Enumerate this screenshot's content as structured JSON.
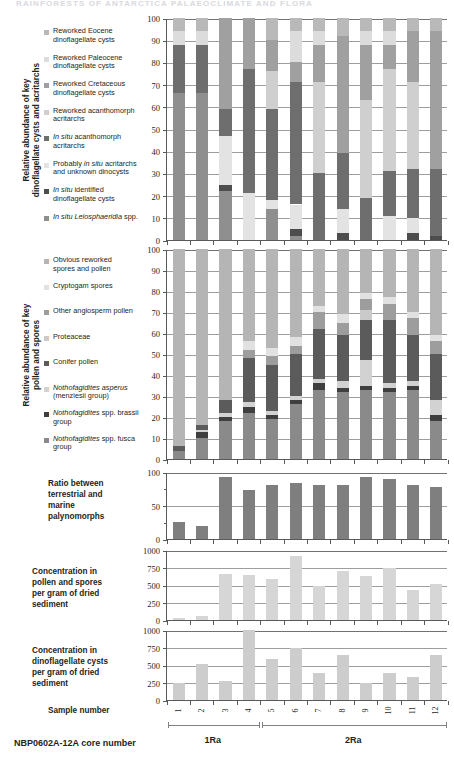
{
  "figure": {
    "running_header": "RAINFORESTS OF ANTARCTICA  PALAEOCLIMATE AND FLORA",
    "bottom_caption": "NBP0602A-12A core number",
    "sample_number_label": "Sample number"
  },
  "samples": [
    "1",
    "2",
    "3",
    "4",
    "5",
    "6",
    "7",
    "8",
    "9",
    "10",
    "11",
    "12"
  ],
  "cores": [
    {
      "label": "1Ra",
      "from": 1,
      "to": 4
    },
    {
      "label": "2Ra",
      "from": 5,
      "to": 12
    }
  ],
  "palette": {
    "dino_reworked_eocene": "#b9b9b9",
    "dino_reworked_paleocene": "#dcdcdc",
    "dino_reworked_cretaceous": "#a0a0a0",
    "dino_reworked_acanthomorph": "#cfcfcf",
    "dino_insitu_acanthomorph": "#6e6e6e",
    "dino_probably_insitu": "#e3e3e3",
    "dino_insitu_identified": "#4d4d4d",
    "dino_insitu_leiosphaeridia": "#8f8f8f",
    "pol_obvious_reworked": "#b5b5b5",
    "pol_cryptogam": "#e1e1e1",
    "pol_other_angiosperm": "#9d9d9d",
    "pol_proteaceae": "#cacaca",
    "pol_conifer": "#5b5b5b",
    "pol_notho_asperus": "#d2d2d2",
    "pol_notho_brassii": "#3f3f3f",
    "pol_notho_fusca": "#8a8a8a",
    "bar_solid_ratio": "#7f7f7f",
    "bar_solid_pollen_conc": "#d6d6d6",
    "bar_solid_dino_conc": "#cdcdcd",
    "axis": "#58595b",
    "grid": "#8c8c8c"
  },
  "panels": {
    "dino": {
      "axis_title": "Relative abundance of key\ndinoflagellate cysts and acritarchs",
      "legend": [
        {
          "key": "dino_reworked_eocene",
          "text": "Reworked Eocene\ndinoflagellate cysts"
        },
        {
          "key": "dino_reworked_paleocene",
          "text": "Reworked Paleocene\ndinoflagellate cysts"
        },
        {
          "key": "dino_reworked_cretaceous",
          "text": "Reworked Cretaceous\ndinoflagellate cysts"
        },
        {
          "key": "dino_reworked_acanthomorph",
          "text": "Reworked acanthomorph\nacritarchs"
        },
        {
          "key": "dino_insitu_acanthomorph",
          "text": "In situ acanthomorph\nacritarchs",
          "italic_prefix": "In situ"
        },
        {
          "key": "dino_probably_insitu",
          "text": "Probably in situ acritarchs\nand unknown dinocysts",
          "italic_prefix": "in situ"
        },
        {
          "key": "dino_insitu_identified",
          "text": "In situ identified\ndinoflagellate cysts",
          "italic_prefix": "In situ"
        },
        {
          "key": "dino_insitu_leiosphaeridia",
          "text": "In situ Leiosphaeridia spp.",
          "italic_prefix": "In situ Leiosphaeridia"
        }
      ],
      "yticks": [
        0,
        10,
        20,
        30,
        40,
        50,
        60,
        70,
        80,
        90,
        100
      ],
      "ylim": [
        0,
        100
      ]
    },
    "pollen": {
      "axis_title": "Relative abundance of key\npollen and spores",
      "legend": [
        {
          "key": "pol_obvious_reworked",
          "text": "Obvious reworked\nspores and pollen"
        },
        {
          "key": "pol_cryptogam",
          "text": "Cryptogam spores"
        },
        {
          "key": "pol_other_angiosperm",
          "text": "Other angiosperm pollen"
        },
        {
          "key": "pol_proteaceae",
          "text": "Proteaceae"
        },
        {
          "key": "pol_conifer",
          "text": "Conifer pollen"
        },
        {
          "key": "pol_notho_asperus",
          "text": "Nothofagidites asperus\n(menziesii group)",
          "italic_prefix": "Nothofagidites asperus"
        },
        {
          "key": "pol_notho_brassii",
          "text": "Nothofagidites spp. brassii\ngroup",
          "italic_prefix": "Nothofagidites"
        },
        {
          "key": "pol_notho_fusca",
          "text": "Nothofagidites  spp. fusca\ngroup",
          "italic_prefix": "Nothofagidites"
        }
      ],
      "yticks": [
        0,
        10,
        20,
        30,
        40,
        50,
        60,
        70,
        80,
        90,
        100
      ],
      "ylim": [
        0,
        100
      ]
    },
    "ratio": {
      "caption": "Ratio between\nterrestrial and\nmarine\npalynomorphs",
      "yticks": [
        0,
        50,
        100
      ],
      "ylim": [
        0,
        100
      ]
    },
    "pollen_conc": {
      "caption": "Concentration in\npollen and spores\nper gram of dried\nsediment",
      "yticks": [
        0,
        250,
        500,
        750,
        1000
      ],
      "ylim": [
        0,
        1000
      ]
    },
    "dino_conc": {
      "caption": "Concentration in\ndinoflagellate cysts\nper gram of dried\nsediment",
      "yticks": [
        0,
        250,
        500,
        750,
        1000
      ],
      "ylim": [
        0,
        1000
      ]
    }
  },
  "chart_data": [
    {
      "type": "bar",
      "id": "dinoflagellate-relative-abundance",
      "stacked": true,
      "title": "Relative abundance of key dinoflagellate cysts and acritarchs",
      "xlabel": "Sample number",
      "ylabel": "Relative abundance (%)",
      "ylim": [
        0,
        100
      ],
      "yticks": [
        0,
        10,
        20,
        30,
        40,
        50,
        60,
        70,
        80,
        90,
        100
      ],
      "grid": true,
      "legend_position": "left",
      "categories": [
        "1",
        "2",
        "3",
        "4",
        "5",
        "6",
        "7",
        "8",
        "9",
        "10",
        "11",
        "12"
      ],
      "series": [
        {
          "name": "In situ Leiosphaeridia spp.",
          "key": "dino_insitu_leiosphaeridia",
          "values": [
            66,
            66,
            22,
            0,
            14,
            2,
            0,
            0,
            0,
            0,
            0,
            0
          ]
        },
        {
          "name": "In situ identified dinoflagellate cysts",
          "key": "dino_insitu_identified",
          "values": [
            0,
            0,
            3,
            0,
            0,
            3,
            0,
            3,
            0,
            0,
            3,
            2
          ]
        },
        {
          "name": "Probably in situ acritarchs and unknown dinocysts",
          "key": "dino_probably_insitu",
          "values": [
            0,
            0,
            22,
            21,
            4,
            11,
            0,
            11,
            0,
            11,
            7,
            0
          ]
        },
        {
          "name": "In situ acanthomorph acritarchs",
          "key": "dino_insitu_acanthomorph",
          "values": [
            22,
            22,
            12,
            56,
            41,
            55,
            30,
            25,
            19,
            20,
            22,
            30
          ]
        },
        {
          "name": "Reworked acanthomorph acritarchs",
          "key": "dino_reworked_acanthomorph",
          "values": [
            0,
            0,
            0,
            0,
            17,
            0,
            41,
            0,
            44,
            46,
            39,
            0
          ]
        },
        {
          "name": "Reworked Cretaceous dinoflagellate cysts",
          "key": "dino_reworked_cretaceous",
          "values": [
            0,
            0,
            41,
            23,
            14,
            9,
            17,
            53,
            25,
            11,
            23,
            62
          ]
        },
        {
          "name": "Reworked Paleocene dinoflagellate cysts",
          "key": "dino_reworked_paleocene",
          "values": [
            6,
            6,
            0,
            0,
            0,
            14,
            6,
            0,
            6,
            6,
            0,
            0
          ]
        },
        {
          "name": "Reworked Eocene dinoflagellate cysts",
          "key": "dino_reworked_eocene",
          "values": [
            6,
            6,
            0,
            0,
            10,
            6,
            6,
            8,
            6,
            6,
            6,
            6
          ]
        }
      ]
    },
    {
      "type": "bar",
      "id": "pollen-spores-relative-abundance",
      "stacked": true,
      "title": "Relative abundance of key pollen and spores",
      "xlabel": "Sample number",
      "ylabel": "Relative abundance (%)",
      "ylim": [
        0,
        100
      ],
      "yticks": [
        0,
        10,
        20,
        30,
        40,
        50,
        60,
        70,
        80,
        90,
        100
      ],
      "grid": true,
      "legend_position": "left",
      "categories": [
        "1",
        "2",
        "3",
        "4",
        "5",
        "6",
        "7",
        "8",
        "9",
        "10",
        "11",
        "12"
      ],
      "series": [
        {
          "name": "Nothofagidites spp. fusca group",
          "key": "pol_notho_fusca",
          "values": [
            4,
            10,
            18,
            22,
            19,
            26,
            33,
            32,
            33,
            32,
            33,
            18
          ]
        },
        {
          "name": "Nothofagidites spp. brassii group",
          "key": "pol_notho_brassii",
          "values": [
            0,
            3,
            2,
            3,
            2,
            2,
            3,
            2,
            2,
            2,
            2,
            3
          ]
        },
        {
          "name": "Nothofagidites asperus (menziesii group)",
          "key": "pol_notho_asperus",
          "values": [
            0,
            1,
            2,
            2,
            2,
            2,
            2,
            3,
            12,
            2,
            2,
            7
          ]
        },
        {
          "name": "Conifer pollen",
          "key": "pol_conifer",
          "values": [
            2,
            2,
            6,
            21,
            22,
            20,
            24,
            22,
            19,
            30,
            22,
            22
          ]
        },
        {
          "name": "Proteaceae",
          "key": "pol_proteaceae",
          "values": [
            0,
            0,
            0,
            0,
            0,
            0,
            0,
            0,
            5,
            0,
            0,
            0
          ]
        },
        {
          "name": "Other angiosperm pollen",
          "key": "pol_other_angiosperm",
          "values": [
            0,
            0,
            0,
            4,
            4,
            4,
            8,
            6,
            5,
            8,
            8,
            6
          ]
        },
        {
          "name": "Cryptogam spores",
          "key": "pol_cryptogam",
          "values": [
            0,
            0,
            0,
            4,
            4,
            4,
            3,
            4,
            3,
            3,
            3,
            3
          ]
        },
        {
          "name": "Obvious reworked spores and pollen",
          "key": "pol_obvious_reworked",
          "values": [
            94,
            84,
            72,
            44,
            47,
            42,
            27,
            31,
            21,
            23,
            30,
            41
          ]
        }
      ]
    },
    {
      "type": "bar",
      "id": "terrestrial-marine-ratio",
      "stacked": false,
      "title": "Ratio between terrestrial and marine palynomorphs",
      "xlabel": "Sample number",
      "ylabel": "",
      "ylim": [
        0,
        100
      ],
      "yticks": [
        0,
        50,
        100
      ],
      "grid": true,
      "categories": [
        "1",
        "2",
        "3",
        "4",
        "5",
        "6",
        "7",
        "8",
        "9",
        "10",
        "11",
        "12"
      ],
      "values": [
        25,
        20,
        93,
        73,
        80,
        83,
        81,
        81,
        92,
        90,
        81,
        77
      ],
      "color_key": "bar_solid_ratio"
    },
    {
      "type": "bar",
      "id": "pollen-spores-concentration",
      "stacked": false,
      "title": "Concentration in pollen and spores per gram of dried sediment",
      "xlabel": "Sample number",
      "ylabel": "",
      "ylim": [
        0,
        1000
      ],
      "yticks": [
        0,
        250,
        500,
        750,
        1000
      ],
      "grid": true,
      "categories": [
        "1",
        "2",
        "3",
        "4",
        "5",
        "6",
        "7",
        "8",
        "9",
        "10",
        "11",
        "12"
      ],
      "values": [
        30,
        60,
        660,
        640,
        580,
        920,
        490,
        700,
        630,
        740,
        430,
        520
      ],
      "color_key": "bar_solid_pollen_conc"
    },
    {
      "type": "bar",
      "id": "dinoflagellate-cyst-concentration",
      "stacked": false,
      "title": "Concentration in dinoflagellate cysts per gram of dried sediment",
      "xlabel": "Sample number",
      "ylabel": "",
      "ylim": [
        0,
        1000
      ],
      "yticks": [
        0,
        250,
        500,
        750,
        1000
      ],
      "grid": true,
      "categories": [
        "1",
        "2",
        "3",
        "4",
        "5",
        "6",
        "7",
        "8",
        "9",
        "10",
        "11",
        "12"
      ],
      "values": [
        250,
        510,
        270,
        1000,
        590,
        750,
        390,
        650,
        250,
        390,
        330,
        650
      ],
      "color_key": "bar_solid_dino_conc"
    }
  ]
}
